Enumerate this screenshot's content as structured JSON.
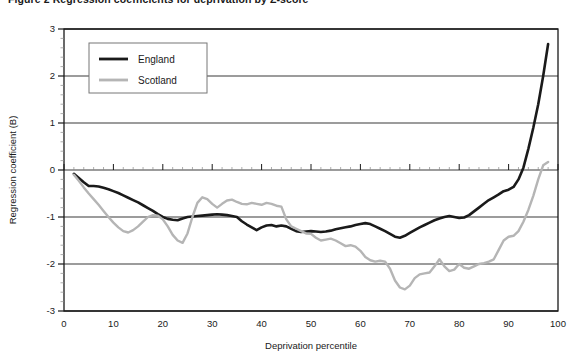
{
  "figure": {
    "caption": "Figure 2  Regression coefficients for deprivation by Z-score",
    "caption_truncated": true
  },
  "chart_data": {
    "type": "line",
    "title": "",
    "xlabel": "Deprivation percentile",
    "ylabel": "Regression coefficient (B)",
    "xlim": [
      0,
      100
    ],
    "ylim": [
      -3,
      3
    ],
    "xticks": [
      0,
      10,
      20,
      30,
      40,
      50,
      60,
      70,
      80,
      90,
      100
    ],
    "yticks": [
      -3,
      -2,
      -1,
      0,
      1,
      2,
      3
    ],
    "xtick_labels": [
      "0",
      "10",
      "20",
      "30",
      "40",
      "50",
      "60",
      "70",
      "80",
      "90",
      "100"
    ],
    "ytick_labels": [
      "-3",
      "-2",
      "-1",
      "0",
      "1",
      "2",
      "3"
    ],
    "grid": "horizontal-major",
    "minor_ticks": true,
    "legend_position": "top-left-inside",
    "series": [
      {
        "name": "England",
        "color": "#1a1a1a",
        "width": 2.6,
        "x": [
          2,
          3,
          4,
          5,
          6,
          7,
          8,
          9,
          10,
          11,
          12,
          13,
          14,
          15,
          16,
          17,
          18,
          19,
          20,
          21,
          22,
          23,
          24,
          25,
          26,
          27,
          28,
          29,
          30,
          31,
          32,
          33,
          34,
          35,
          36,
          37,
          38,
          39,
          40,
          41,
          42,
          43,
          44,
          45,
          46,
          47,
          48,
          49,
          50,
          51,
          52,
          53,
          54,
          55,
          56,
          57,
          58,
          59,
          60,
          61,
          62,
          63,
          64,
          65,
          66,
          67,
          68,
          69,
          70,
          71,
          72,
          73,
          74,
          75,
          76,
          77,
          78,
          79,
          80,
          81,
          82,
          83,
          84,
          85,
          86,
          87,
          88,
          89,
          90,
          91,
          92,
          93,
          94,
          95,
          96,
          97,
          98
        ],
        "y": [
          -0.08,
          -0.17,
          -0.26,
          -0.34,
          -0.34,
          -0.35,
          -0.38,
          -0.41,
          -0.45,
          -0.49,
          -0.54,
          -0.59,
          -0.64,
          -0.69,
          -0.75,
          -0.81,
          -0.87,
          -0.94,
          -1.0,
          -1.04,
          -1.06,
          -1.07,
          -1.03,
          -1.0,
          -0.99,
          -0.98,
          -0.97,
          -0.96,
          -0.95,
          -0.94,
          -0.95,
          -0.96,
          -0.98,
          -1.0,
          -1.09,
          -1.16,
          -1.22,
          -1.28,
          -1.22,
          -1.18,
          -1.17,
          -1.2,
          -1.18,
          -1.2,
          -1.25,
          -1.3,
          -1.32,
          -1.31,
          -1.3,
          -1.31,
          -1.32,
          -1.31,
          -1.29,
          -1.26,
          -1.24,
          -1.22,
          -1.2,
          -1.17,
          -1.15,
          -1.13,
          -1.15,
          -1.2,
          -1.25,
          -1.3,
          -1.36,
          -1.42,
          -1.44,
          -1.4,
          -1.34,
          -1.28,
          -1.22,
          -1.17,
          -1.12,
          -1.07,
          -1.03,
          -1.0,
          -0.98,
          -1.0,
          -1.02,
          -1.01,
          -0.96,
          -0.88,
          -0.8,
          -0.72,
          -0.64,
          -0.58,
          -0.52,
          -0.45,
          -0.42,
          -0.36,
          -0.2,
          0.05,
          0.45,
          0.9,
          1.4,
          2.0,
          2.68
        ]
      },
      {
        "name": "Scotland",
        "color": "#b5b5b5",
        "width": 2.4,
        "x": [
          2,
          3,
          4,
          5,
          6,
          7,
          8,
          9,
          10,
          11,
          12,
          13,
          14,
          15,
          16,
          17,
          18,
          19,
          20,
          21,
          22,
          23,
          24,
          25,
          26,
          27,
          28,
          29,
          30,
          31,
          32,
          33,
          34,
          35,
          36,
          37,
          38,
          39,
          40,
          41,
          42,
          43,
          44,
          45,
          46,
          47,
          48,
          49,
          50,
          51,
          52,
          53,
          54,
          55,
          56,
          57,
          58,
          59,
          60,
          61,
          62,
          63,
          64,
          65,
          66,
          67,
          68,
          69,
          70,
          71,
          72,
          73,
          74,
          75,
          76,
          77,
          78,
          79,
          80,
          81,
          82,
          83,
          84,
          85,
          86,
          87,
          88,
          89,
          90,
          91,
          92,
          93,
          94,
          95,
          96,
          97,
          98
        ],
        "y": [
          -0.1,
          -0.23,
          -0.37,
          -0.5,
          -0.62,
          -0.74,
          -0.87,
          -1.0,
          -1.12,
          -1.22,
          -1.3,
          -1.33,
          -1.28,
          -1.2,
          -1.1,
          -1.0,
          -0.96,
          -0.97,
          -1.05,
          -1.2,
          -1.38,
          -1.5,
          -1.55,
          -1.35,
          -1.0,
          -0.7,
          -0.58,
          -0.62,
          -0.72,
          -0.8,
          -0.72,
          -0.65,
          -0.63,
          -0.68,
          -0.72,
          -0.73,
          -0.7,
          -0.72,
          -0.74,
          -0.7,
          -0.72,
          -0.76,
          -0.78,
          -1.05,
          -1.2,
          -1.25,
          -1.3,
          -1.35,
          -1.36,
          -1.44,
          -1.5,
          -1.48,
          -1.46,
          -1.5,
          -1.56,
          -1.62,
          -1.6,
          -1.63,
          -1.72,
          -1.85,
          -1.92,
          -1.95,
          -1.93,
          -1.95,
          -2.1,
          -2.35,
          -2.5,
          -2.54,
          -2.46,
          -2.3,
          -2.22,
          -2.2,
          -2.18,
          -2.05,
          -1.9,
          -2.05,
          -2.15,
          -2.12,
          -2.0,
          -2.08,
          -2.1,
          -2.05,
          -2.0,
          -1.98,
          -1.95,
          -1.9,
          -1.7,
          -1.5,
          -1.42,
          -1.4,
          -1.3,
          -1.1,
          -0.85,
          -0.55,
          -0.2,
          0.1,
          0.17
        ]
      }
    ]
  },
  "legend": {
    "entries": [
      {
        "label": "England",
        "color": "#1a1a1a"
      },
      {
        "label": "Scotland",
        "color": "#b5b5b5"
      }
    ]
  },
  "colors": {
    "england": "#1a1a1a",
    "scotland": "#b5b5b5",
    "axis": "#1a1a1a",
    "grid": "#3a3a3a",
    "background": "#ffffff"
  }
}
